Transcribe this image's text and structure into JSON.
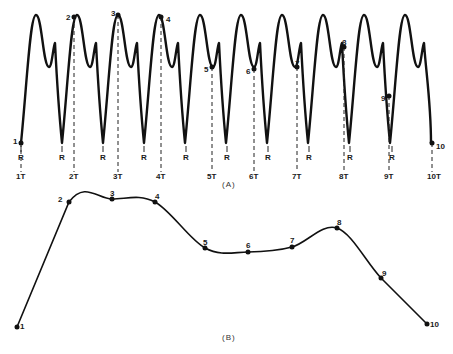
{
  "figure": {
    "panel_a": {
      "caption": "(A)",
      "start_x": 21,
      "period": 41,
      "cycles": 10,
      "baseline_y": 143,
      "peak_y": 15,
      "notch_y": 43,
      "notch_trough_y": 67,
      "points": [
        {
          "label": "1",
          "x": 21,
          "y": 143,
          "label_dx": -8,
          "label_dy": -2
        },
        {
          "label": "2",
          "x": 74,
          "y": 17,
          "label_dx": -8,
          "label_dy": 0
        },
        {
          "label": "3",
          "x": 118,
          "y": 15,
          "label_dx": -7,
          "label_dy": -2
        },
        {
          "label": "4",
          "x": 161,
          "y": 17,
          "label_dx": 5,
          "label_dy": 2
        },
        {
          "label": "5",
          "x": 212,
          "y": 67,
          "label_dx": -8,
          "label_dy": 2
        },
        {
          "label": "6",
          "x": 254,
          "y": 69,
          "label_dx": -8,
          "label_dy": 2
        },
        {
          "label": "7",
          "x": 297,
          "y": 67,
          "label_dx": -2,
          "label_dy": -4
        },
        {
          "label": "8",
          "x": 344,
          "y": 47,
          "label_dx": -2,
          "label_dy": -5
        },
        {
          "label": "9",
          "x": 389,
          "y": 96,
          "label_dx": -8,
          "label_dy": 2
        },
        {
          "label": "10",
          "x": 432,
          "y": 143,
          "label_dx": 4,
          "label_dy": 3
        }
      ],
      "r_labels": [
        {
          "label": "R",
          "x": 21
        },
        {
          "label": "R",
          "x": 62
        },
        {
          "label": "R",
          "x": 103
        },
        {
          "label": "R",
          "x": 144
        },
        {
          "label": "R",
          "x": 186
        },
        {
          "label": "R",
          "x": 227
        },
        {
          "label": "R",
          "x": 268
        },
        {
          "label": "R",
          "x": 309
        },
        {
          "label": "R",
          "x": 350
        },
        {
          "label": "R",
          "x": 392
        }
      ],
      "t_labels": [
        {
          "label": "1T",
          "x": 21
        },
        {
          "label": "2T",
          "x": 74
        },
        {
          "label": "3T",
          "x": 118
        },
        {
          "label": "4T",
          "x": 161
        },
        {
          "label": "5T",
          "x": 212
        },
        {
          "label": "6T",
          "x": 254
        },
        {
          "label": "7T",
          "x": 297
        },
        {
          "label": "8T",
          "x": 344
        },
        {
          "label": "9T",
          "x": 389
        },
        {
          "label": "10T",
          "x": 432
        }
      ]
    },
    "panel_b": {
      "caption": "(B)",
      "points": [
        {
          "label": "1",
          "x": 17,
          "y": 327,
          "label_dx": 5,
          "label_dy": 0
        },
        {
          "label": "2",
          "x": 69,
          "y": 202,
          "label_dx": -9,
          "label_dy": -2
        },
        {
          "label": "3",
          "x": 112,
          "y": 199,
          "label_dx": 0,
          "label_dy": -5
        },
        {
          "label": "4",
          "x": 155,
          "y": 202,
          "label_dx": 2,
          "label_dy": -5
        },
        {
          "label": "5",
          "x": 205,
          "y": 248,
          "label_dx": 0,
          "label_dy": -5
        },
        {
          "label": "6",
          "x": 248,
          "y": 252,
          "label_dx": 0,
          "label_dy": -6
        },
        {
          "label": "7",
          "x": 292,
          "y": 247,
          "label_dx": 0,
          "label_dy": -6
        },
        {
          "label": "8",
          "x": 337,
          "y": 228,
          "label_dx": 2,
          "label_dy": -5
        },
        {
          "label": "9",
          "x": 381,
          "y": 278,
          "label_dx": 3,
          "label_dy": -4
        },
        {
          "label": "10",
          "x": 427,
          "y": 324,
          "label_dx": 5,
          "label_dy": 1
        }
      ]
    }
  }
}
